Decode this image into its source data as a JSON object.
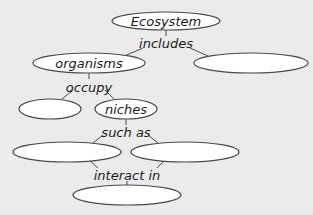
{
  "diagram": {
    "type": "concept-map",
    "background": "#ebebeb",
    "nodes": [
      {
        "id": "ecosystem",
        "label": "Ecosystem",
        "cx": 166,
        "cy": 21,
        "rx": 54,
        "ry": 9
      },
      {
        "id": "blank-right-top",
        "label": "",
        "cx": 251,
        "cy": 63,
        "rx": 57,
        "ry": 10
      },
      {
        "id": "organisms",
        "label": "organisms",
        "cx": 89,
        "cy": 63,
        "rx": 56,
        "ry": 10
      },
      {
        "id": "blank-left-mid",
        "label": "",
        "cx": 50,
        "cy": 109,
        "rx": 31,
        "ry": 10
      },
      {
        "id": "niches",
        "label": "niches",
        "cx": 126,
        "cy": 109,
        "rx": 31,
        "ry": 10
      },
      {
        "id": "blank-left-low",
        "label": "",
        "cx": 67,
        "cy": 152,
        "rx": 54,
        "ry": 10
      },
      {
        "id": "blank-right-low",
        "label": "",
        "cx": 185,
        "cy": 152,
        "rx": 54,
        "ry": 10
      },
      {
        "id": "blank-bottom",
        "label": "",
        "cx": 127,
        "cy": 195,
        "rx": 54,
        "ry": 10
      }
    ],
    "linking_phrases": [
      {
        "id": "includes",
        "label": "includes",
        "x": 166,
        "y": 48
      },
      {
        "id": "occupy",
        "label": "occupy",
        "x": 89,
        "y": 92
      },
      {
        "id": "such-as",
        "label": "such as",
        "x": 126,
        "y": 137
      },
      {
        "id": "interact-in",
        "label": "interact in",
        "x": 127,
        "y": 180
      }
    ]
  }
}
